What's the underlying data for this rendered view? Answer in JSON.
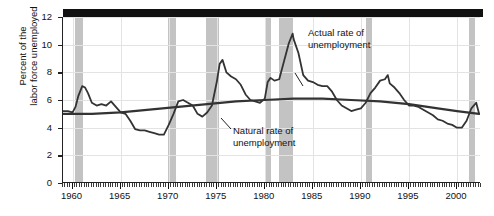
{
  "chart_data": {
    "type": "line",
    "title": "",
    "xlabel": "",
    "ylabel_line1": "Percent of the",
    "ylabel_line2": "labor force unemployed",
    "xlim": [
      1959.0,
      2002.5
    ],
    "ylim": [
      0,
      12
    ],
    "yticks": [
      0,
      2,
      4,
      6,
      8,
      10,
      12
    ],
    "ytick_labels": [
      "0",
      "2",
      "4",
      "6",
      "8",
      "10",
      "12"
    ],
    "xticks": [
      1960,
      1965,
      1970,
      1975,
      1980,
      1985,
      1990,
      1995,
      2000
    ],
    "xtick_labels": [
      "1960",
      "1965",
      "1970",
      "1975",
      "1980",
      "1985",
      "1990",
      "1995",
      "2000"
    ],
    "grid": "major gridlines on both axes, light gray",
    "legend": "inline annotations",
    "series": [
      {
        "name": "Actual rate of unemployment",
        "color": "#333333",
        "x": [
          1959.0,
          1959.5,
          1960.0,
          1960.3,
          1960.6,
          1961.0,
          1961.3,
          1961.6,
          1962.0,
          1962.5,
          1963.0,
          1963.5,
          1964.0,
          1964.5,
          1965.0,
          1965.5,
          1966.0,
          1966.5,
          1967.0,
          1967.5,
          1968.0,
          1968.5,
          1969.0,
          1969.5,
          1970.0,
          1970.5,
          1971.0,
          1971.5,
          1972.0,
          1972.5,
          1973.0,
          1973.5,
          1974.0,
          1974.5,
          1975.0,
          1975.3,
          1975.6,
          1976.0,
          1976.5,
          1977.0,
          1977.5,
          1978.0,
          1978.5,
          1979.0,
          1979.5,
          1980.0,
          1980.3,
          1980.6,
          1981.0,
          1981.5,
          1982.0,
          1982.5,
          1982.9,
          1983.0,
          1983.5,
          1984.0,
          1984.5,
          1985.0,
          1985.5,
          1986.0,
          1986.5,
          1987.0,
          1987.5,
          1988.0,
          1988.5,
          1989.0,
          1989.5,
          1990.0,
          1990.5,
          1991.0,
          1991.5,
          1992.0,
          1992.5,
          1992.8,
          1993.0,
          1993.5,
          1994.0,
          1994.5,
          1995.0,
          1995.5,
          1996.0,
          1996.5,
          1997.0,
          1997.5,
          1998.0,
          1998.5,
          1999.0,
          1999.5,
          2000.0,
          2000.5,
          2001.0,
          2001.5,
          2002.0,
          2002.3
        ],
        "y": [
          5.2,
          5.2,
          5.1,
          5.5,
          6.3,
          7.0,
          6.9,
          6.5,
          5.8,
          5.6,
          5.7,
          5.6,
          5.9,
          5.5,
          5.1,
          5.0,
          4.5,
          3.9,
          3.8,
          3.8,
          3.7,
          3.6,
          3.5,
          3.5,
          4.2,
          5.0,
          5.9,
          6.0,
          5.8,
          5.6,
          5.0,
          4.8,
          5.1,
          5.6,
          7.3,
          8.6,
          8.9,
          8.0,
          7.7,
          7.5,
          7.1,
          6.4,
          6.0,
          5.9,
          5.8,
          6.1,
          7.3,
          7.6,
          7.4,
          7.5,
          8.8,
          10.1,
          10.8,
          10.4,
          9.4,
          7.8,
          7.4,
          7.3,
          7.1,
          7.0,
          7.0,
          6.6,
          6.0,
          5.6,
          5.4,
          5.2,
          5.3,
          5.4,
          5.8,
          6.5,
          6.9,
          7.4,
          7.5,
          7.8,
          7.2,
          6.9,
          6.5,
          6.0,
          5.6,
          5.6,
          5.5,
          5.3,
          5.1,
          4.9,
          4.6,
          4.5,
          4.3,
          4.2,
          4.0,
          4.0,
          4.5,
          5.4,
          5.8,
          5.0
        ]
      },
      {
        "name": "Natural rate of unemployment",
        "color": "#333333",
        "x": [
          1959.0,
          1962.0,
          1965.0,
          1968.0,
          1971.0,
          1974.0,
          1977.0,
          1980.0,
          1983.0,
          1986.0,
          1989.0,
          1992.0,
          1995.0,
          1998.0,
          2000.0,
          2002.3
        ],
        "y": [
          5.0,
          5.0,
          5.1,
          5.3,
          5.5,
          5.7,
          5.9,
          6.0,
          6.1,
          6.1,
          6.0,
          5.9,
          5.7,
          5.4,
          5.2,
          5.0
        ]
      }
    ],
    "recession_bands": [
      {
        "start": 1960.3,
        "end": 1961.1
      },
      {
        "start": 1969.9,
        "end": 1970.8
      },
      {
        "start": 1973.9,
        "end": 1975.2
      },
      {
        "start": 1980.0,
        "end": 1980.6
      },
      {
        "start": 1981.5,
        "end": 1982.9
      },
      {
        "start": 1990.5,
        "end": 1991.2
      },
      {
        "start": 2001.2,
        "end": 2001.9
      }
    ],
    "band_color": "#c3c3c3",
    "annotations": [
      {
        "name": "actual-rate-annotation",
        "line1": "Actual rate of",
        "line2": "unemployment"
      },
      {
        "name": "natural-rate-annotation",
        "line1": "Natural rate of",
        "line2": "unemployment"
      }
    ],
    "top_bar_color": "#111111"
  }
}
